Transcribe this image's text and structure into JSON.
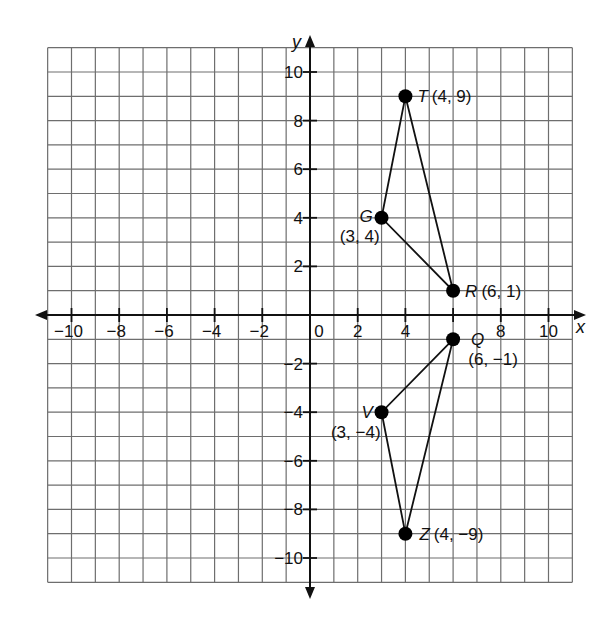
{
  "chart_data": {
    "type": "scatter",
    "title": "",
    "xlabel": "x",
    "ylabel": "y",
    "xlim": [
      -11,
      11
    ],
    "ylim": [
      -11,
      11
    ],
    "grid": true,
    "x_ticks": [
      -10,
      -8,
      -6,
      -4,
      -2,
      0,
      2,
      4,
      8,
      10
    ],
    "y_ticks": [
      10,
      8,
      6,
      4,
      2,
      -2,
      -4,
      -6,
      -8,
      -10
    ],
    "points": [
      {
        "name": "T",
        "x": 4,
        "y": 9,
        "label": "(4, 9)"
      },
      {
        "name": "G",
        "x": 3,
        "y": 4,
        "label": "(3, 4)"
      },
      {
        "name": "R",
        "x": 6,
        "y": 1,
        "label": "(6, 1)"
      },
      {
        "name": "Q",
        "x": 6,
        "y": -1,
        "label": "(6, −1)"
      },
      {
        "name": "V",
        "x": 3,
        "y": -4,
        "label": "(3, −4)"
      },
      {
        "name": "Z",
        "x": 4,
        "y": -9,
        "label": "(4, −9)"
      }
    ],
    "polygons": [
      {
        "name": "triangle-TGR",
        "vertices": [
          "T",
          "G",
          "R"
        ]
      },
      {
        "name": "triangle-QVZ",
        "vertices": [
          "Q",
          "V",
          "Z"
        ]
      }
    ],
    "legend": null
  },
  "colors": {
    "grid": "#6e6e6e",
    "axis": "#111111",
    "point": "#000000",
    "background": "#ffffff"
  }
}
